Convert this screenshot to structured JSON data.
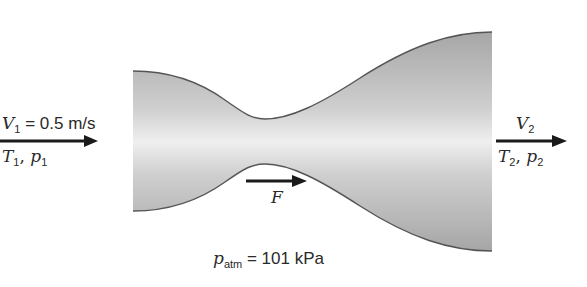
{
  "diagram": {
    "type": "converging-diverging nozzle control volume",
    "colors": {
      "nozzle_fill_dark": "#a9a9a9",
      "nozzle_fill_light": "#ececec",
      "nozzle_outline": "#555555",
      "arrow": "#1a1a1a",
      "text": "#2a2a2a"
    },
    "inlet": {
      "velocity_symbol": "V",
      "velocity_sub": "1",
      "velocity_value": " = 0.5 m/s",
      "state_T": "T",
      "state_T_sub": "1",
      "state_sep": ", ",
      "state_p": "p",
      "state_p_sub": "1"
    },
    "outlet": {
      "velocity_symbol": "V",
      "velocity_sub": "2",
      "state_T": "T",
      "state_T_sub": "2",
      "state_sep": ", ",
      "state_p": "p",
      "state_p_sub": "2"
    },
    "force": {
      "symbol": "F"
    },
    "ambient": {
      "symbol": "p",
      "sub": "atm",
      "value": " = 101 kPa"
    }
  }
}
